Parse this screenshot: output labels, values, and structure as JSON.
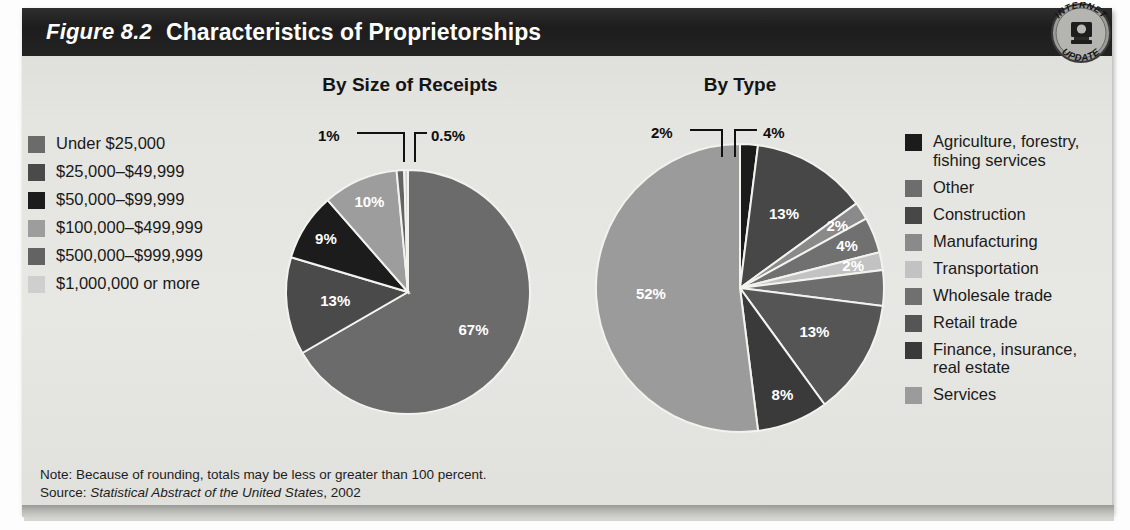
{
  "figure": {
    "number": "Figure 8.2",
    "title": "Characteristics of Proprietorships",
    "badge": {
      "top_text": "INTERNET",
      "bottom_text": "UPDATE",
      "icon": "computer-monitor-icon"
    }
  },
  "charts": {
    "left_title": "By Size of Receipts",
    "right_title": "By Type"
  },
  "legend_left": {
    "items": [
      {
        "label": "Under $25,000",
        "color": "#6b6b6b"
      },
      {
        "label": "$25,000–$49,999",
        "color": "#4a4a4a"
      },
      {
        "label": "$50,000–$99,999",
        "color": "#1c1c1c"
      },
      {
        "label": "$100,000–$499,999",
        "color": "#9d9d9d"
      },
      {
        "label": "$500,000–$999,999",
        "color": "#636363"
      },
      {
        "label": "$1,000,000 or more",
        "color": "#cfcfcf"
      }
    ]
  },
  "legend_right": {
    "items": [
      {
        "label": "Agriculture, forestry,\nfishing services",
        "color": "#1b1b1b"
      },
      {
        "label": "Other",
        "color": "#6d6d6d"
      },
      {
        "label": "Construction",
        "color": "#474747"
      },
      {
        "label": "Manufacturing",
        "color": "#8a8a8a"
      },
      {
        "label": "Transportation",
        "color": "#c2c2c2"
      },
      {
        "label": "Wholesale trade",
        "color": "#707070"
      },
      {
        "label": "Retail trade",
        "color": "#555555"
      },
      {
        "label": "Finance, insurance,\nreal estate",
        "color": "#3a3a3a"
      },
      {
        "label": "Services",
        "color": "#9b9b9b"
      }
    ]
  },
  "callouts": {
    "left_1": "1%",
    "left_05": "0.5%",
    "right_2": "2%",
    "right_4": "4%"
  },
  "footnotes": {
    "note": "Note: Because of rounding, totals may be less or greater than 100 percent.",
    "source_prefix": "Source: ",
    "source_italic": "Statistical Abstract of the United States",
    "source_suffix": ", 2002"
  },
  "chart_data": [
    {
      "type": "pie",
      "title": "By Size of Receipts",
      "categories": [
        "Under $25,000",
        "$25,000–$49,999",
        "$50,000–$99,999",
        "$100,000–$499,999",
        "$500,000–$999,999",
        "$1,000,000 or more"
      ],
      "values": [
        67,
        13,
        9,
        10,
        1,
        0.5
      ],
      "labels": [
        "67%",
        "13%",
        "9%",
        "10%",
        "1%",
        "0.5%"
      ],
      "colors": [
        "#6b6b6b",
        "#4a4a4a",
        "#1c1c1c",
        "#9d9d9d",
        "#636363",
        "#cfcfcf"
      ],
      "label_inside": [
        true,
        true,
        true,
        true,
        false,
        false
      ],
      "start_angle_deg": 0,
      "direction": "clockwise",
      "legend_position": "left",
      "grid": false,
      "units": "percent"
    },
    {
      "type": "pie",
      "title": "By Type",
      "categories": [
        "Agriculture, forestry, fishing services",
        "Construction",
        "Manufacturing",
        "Wholesale trade",
        "Transportation",
        "Other",
        "Retail trade",
        "Finance, insurance, real estate",
        "Services"
      ],
      "values": [
        2,
        13,
        2,
        4,
        2,
        4,
        13,
        8,
        52
      ],
      "labels": [
        "2%",
        "13%",
        "2%",
        "4%",
        "2%",
        "4%",
        "13%",
        "8%",
        "52%"
      ],
      "colors": [
        "#1b1b1b",
        "#474747",
        "#8a8a8a",
        "#707070",
        "#c2c2c2",
        "#6d6d6d",
        "#555555",
        "#3a3a3a",
        "#9b9b9b"
      ],
      "label_inside": [
        false,
        true,
        true,
        true,
        true,
        false,
        true,
        true,
        true
      ],
      "start_angle_deg": 0,
      "direction": "clockwise",
      "legend_position": "right",
      "grid": false,
      "units": "percent"
    }
  ]
}
